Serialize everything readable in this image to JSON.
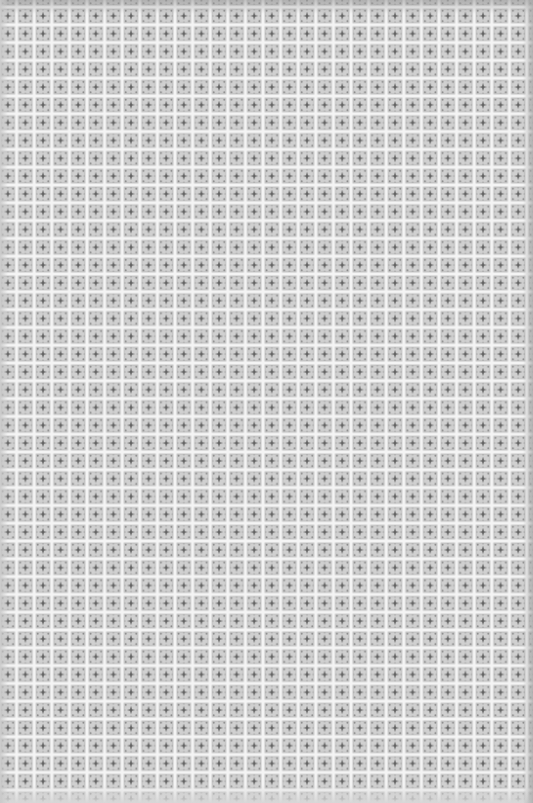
{
  "image": {
    "description": "Photographed sheet of repeating square tile pattern with white grout grid lines and gray quatrefoil/cross motifs",
    "width": 533,
    "height": 803,
    "pattern": {
      "tile_pitch_x": 17.6,
      "tile_pitch_y": 17.8,
      "grout_width": 2.5,
      "colors": {
        "grout": "#f4f4f4",
        "tile_base": "#bdbdbd",
        "tile_light": "#d2d2d2",
        "motif_dark": "#6e6e6e",
        "motif_mid": "#8f8f8f"
      }
    }
  }
}
